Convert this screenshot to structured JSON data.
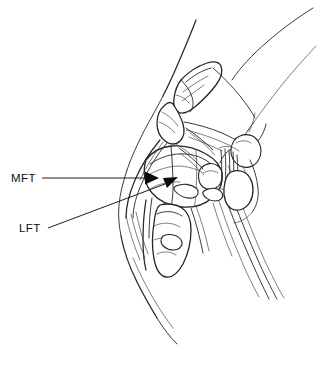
{
  "figure": {
    "name": "knee-joint-sagittal-illustration",
    "background_color": "#ffffff",
    "ink_color": "#262626",
    "width": 317,
    "height": 379
  },
  "labels": [
    {
      "id": "mft",
      "text": "MFT",
      "x": 11,
      "y": 182,
      "leader": {
        "type": "straight-arrow",
        "from_x": 42,
        "from_y": 178,
        "to_x": 152,
        "to_y": 178
      }
    },
    {
      "id": "lft",
      "text": "LFT",
      "x": 19,
      "y": 232,
      "leader": {
        "type": "straight-arrow",
        "from_x": 48,
        "from_y": 228,
        "to_x": 176,
        "to_y": 180
      }
    }
  ],
  "structures": [
    {
      "id": "patella",
      "label": "patella"
    },
    {
      "id": "femur-shaft",
      "label": "femur shaft"
    },
    {
      "id": "femoral-condyle",
      "label": "femoral condyle"
    },
    {
      "id": "tibial-plateau",
      "label": "tibial plateau"
    },
    {
      "id": "tibia",
      "label": "tibia"
    },
    {
      "id": "patellar-tendon",
      "label": "patellar tendon"
    },
    {
      "id": "cruciate-ligament",
      "label": "cruciate ligament"
    },
    {
      "id": "posterior-soft-tissue",
      "label": "posterior soft tissue"
    },
    {
      "id": "skin-contour-anterior",
      "label": "anterior skin contour"
    },
    {
      "id": "skin-contour-posterior",
      "label": "posterior skin contour"
    }
  ]
}
